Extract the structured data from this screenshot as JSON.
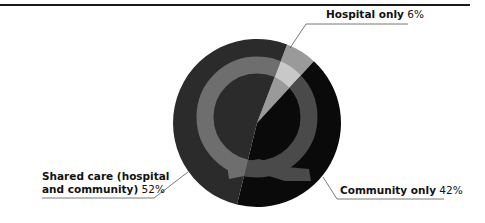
{
  "chart_data": {
    "type": "pie",
    "title": "",
    "categories": [
      "Hospital only",
      "Community only",
      "Shared care (hospital and community)"
    ],
    "values": [
      6,
      42,
      52
    ],
    "unit": "%",
    "start_angle_deg": 21,
    "direction": "clockwise",
    "colors": [
      "#9a9a9a",
      "#0a0a0a",
      "#2b2b2b"
    ],
    "watermark_colors": [
      "#c8c8c8",
      "#4a4a4a",
      "#6e6e6e"
    ],
    "watermark": "Q",
    "labels": [
      {
        "name": "Hospital only",
        "value_text": "6%"
      },
      {
        "name": "Community only",
        "value_text": "42%"
      },
      {
        "name_line1": "Shared care (hospital",
        "name_line2": "and community)",
        "value_text": "52%"
      }
    ],
    "legend": "none (leader-line labels)",
    "grid": false
  }
}
